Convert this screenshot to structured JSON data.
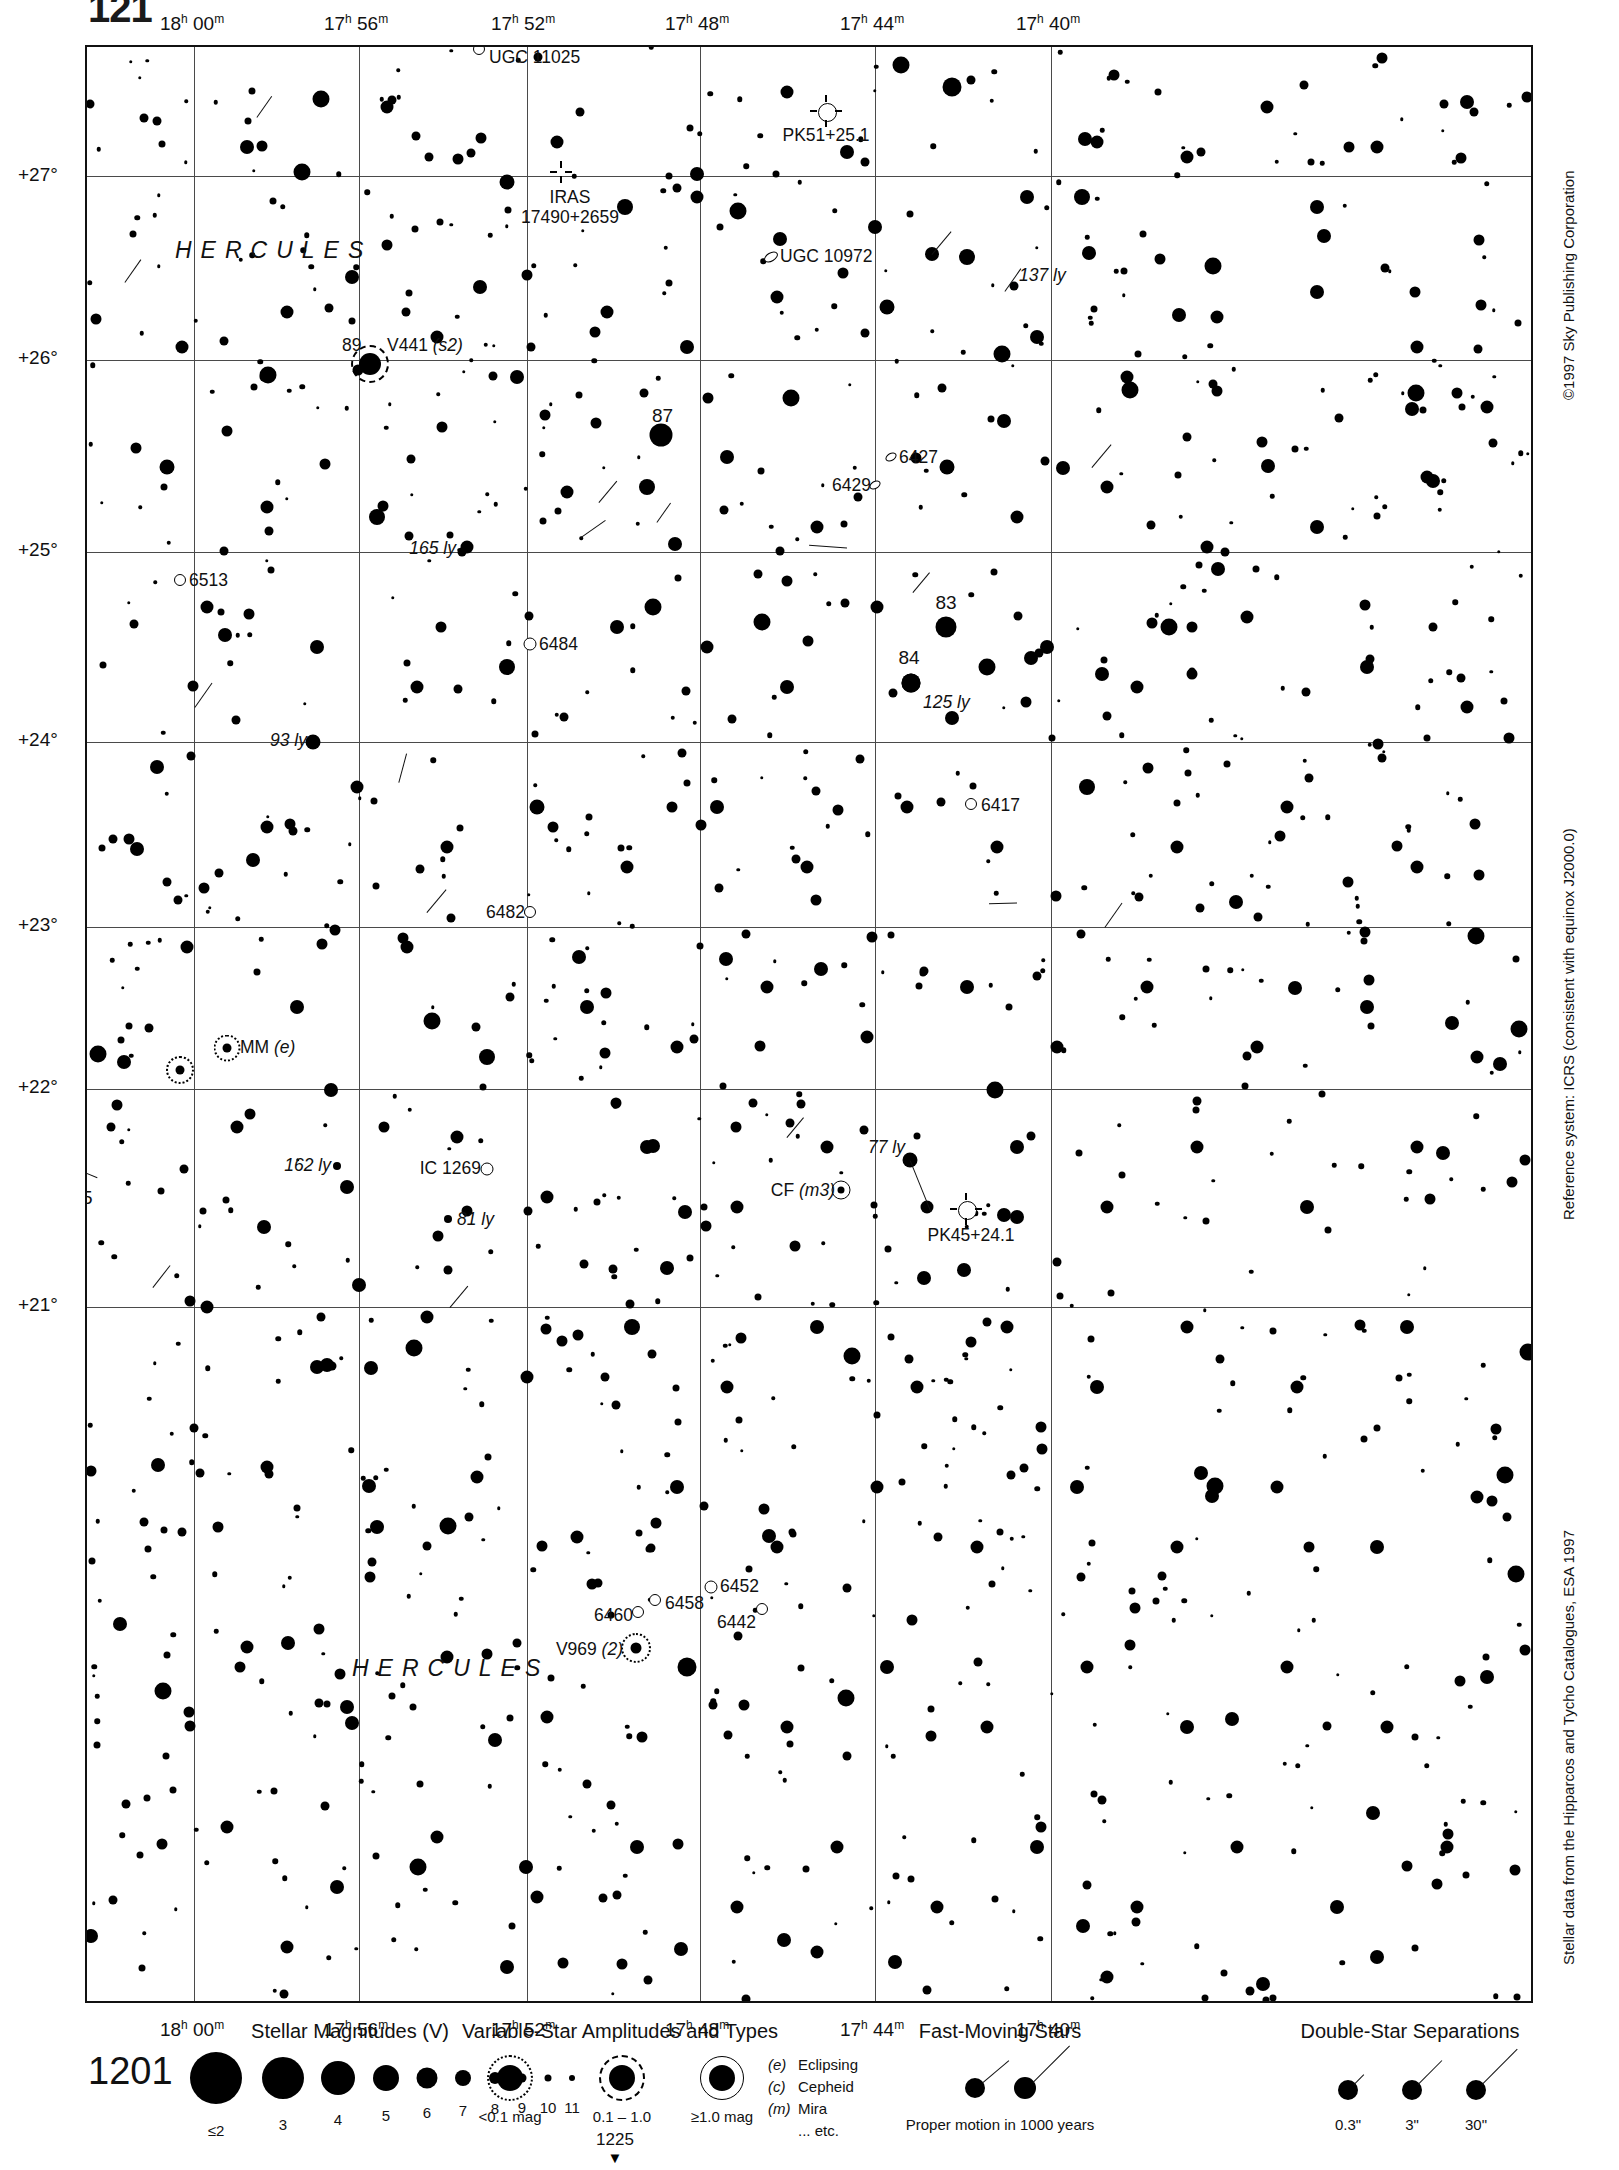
{
  "page": {
    "number_top": "121",
    "header_center": "HERCULES",
    "chart_number": "1201",
    "adjacent_chart_number": "1225"
  },
  "margin_notes": {
    "copyright": "©1997 Sky Publishing Corporation",
    "reference_system": "Reference system: ICRS (consistent with equinox J2000.0)",
    "data_source": "Stellar data from the Hipparcos and Tycho Catalogues, ESA 1997"
  },
  "axes": {
    "ra_ticks_top": [
      "18h 00m",
      "17h 56m",
      "17h 52m",
      "17h 48m",
      "17h 44m",
      "17h 40m"
    ],
    "ra_ticks_bottom": [
      "18h 00m",
      "17h 56m",
      "17h 52m",
      "17h 48m",
      "17h 44m",
      "17h 40m"
    ],
    "dec_ticks": [
      "+27°",
      "+26°",
      "+25°",
      "+24°",
      "+23°",
      "+22°",
      "+21°"
    ]
  },
  "constellation_labels": [
    "HERCULES",
    "HERCULES"
  ],
  "object_labels": [
    {
      "text": "UGC 11025",
      "kind": "galaxy"
    },
    {
      "text": "PK51+25.1",
      "kind": "planetary-nebula"
    },
    {
      "text": "IRAS 17490+2659",
      "kind": "iras-source"
    },
    {
      "text": "UGC 10972",
      "kind": "galaxy"
    },
    {
      "text": "137 ly",
      "kind": "distance"
    },
    {
      "text": "89",
      "kind": "flamsteed"
    },
    {
      "text": "V441 (s2)",
      "kind": "variable-star"
    },
    {
      "text": "87",
      "kind": "flamsteed"
    },
    {
      "text": "6427",
      "kind": "ngc-galaxy"
    },
    {
      "text": "6429",
      "kind": "ngc-galaxy"
    },
    {
      "text": "165 ly",
      "kind": "distance"
    },
    {
      "text": "6513",
      "kind": "ngc-galaxy"
    },
    {
      "text": "6484",
      "kind": "ngc-galaxy"
    },
    {
      "text": "83",
      "kind": "flamsteed"
    },
    {
      "text": "84",
      "kind": "flamsteed"
    },
    {
      "text": "125 ly",
      "kind": "distance"
    },
    {
      "text": "93 ly",
      "kind": "distance"
    },
    {
      "text": "6417",
      "kind": "ngc-galaxy"
    },
    {
      "text": "6482",
      "kind": "ngc-galaxy"
    },
    {
      "text": "MM (e)",
      "kind": "variable-star"
    },
    {
      "text": "95",
      "kind": "flamsteed"
    },
    {
      "text": "162 ly",
      "kind": "distance"
    },
    {
      "text": "IC 1269",
      "kind": "ic-galaxy"
    },
    {
      "text": "81 ly",
      "kind": "distance"
    },
    {
      "text": "CF (m3)",
      "kind": "variable-star"
    },
    {
      "text": "77 ly",
      "kind": "distance"
    },
    {
      "text": "PK45+24.1",
      "kind": "planetary-nebula"
    },
    {
      "text": "6452",
      "kind": "ngc-galaxy"
    },
    {
      "text": "6458",
      "kind": "ngc-galaxy"
    },
    {
      "text": "6460",
      "kind": "ngc-galaxy"
    },
    {
      "text": "6442",
      "kind": "ngc-galaxy"
    },
    {
      "text": "V969 (2)",
      "kind": "variable-star"
    }
  ],
  "legend": {
    "magnitudes": {
      "title": "Stellar Magnitudes (V)",
      "labels": [
        "≤2",
        "3",
        "4",
        "5",
        "6",
        "7",
        "8",
        "9",
        "10",
        "11"
      ]
    },
    "variables": {
      "title": "Variable-Star Amplitudes and Types",
      "amplitudes": [
        "<0.1 mag",
        "0.1 – 1.0",
        "≥1.0 mag"
      ],
      "types": [
        {
          "code": "(e)",
          "name": "Eclipsing"
        },
        {
          "code": "(c)",
          "name": "Cepheid"
        },
        {
          "code": "(m)",
          "name": "Mira"
        },
        {
          "code": "",
          "name": "... etc."
        }
      ]
    },
    "fast_moving": {
      "title": "Fast-Moving Stars",
      "caption": "Proper motion in 1000 years"
    },
    "doubles": {
      "title": "Double-Star Separations",
      "labels": [
        "0.3\"",
        "3\"",
        "30\""
      ]
    }
  },
  "chart_data": {
    "type": "scatter",
    "xlabel": "Right Ascension (J2000.0)",
    "ylabel": "Declination (J2000.0)",
    "xlim": [
      "18h 02m",
      "17h 38m"
    ],
    "ylim": [
      20.5,
      27.6
    ],
    "grid": true,
    "legend_position": "below-plot",
    "magnitude_scale": {
      "2": 26,
      "3": 21,
      "4": 17,
      "5": 14,
      "6": 11,
      "7": 9,
      "8": 7,
      "9": 5.5,
      "10": 4.5,
      "11": 3.5
    }
  }
}
